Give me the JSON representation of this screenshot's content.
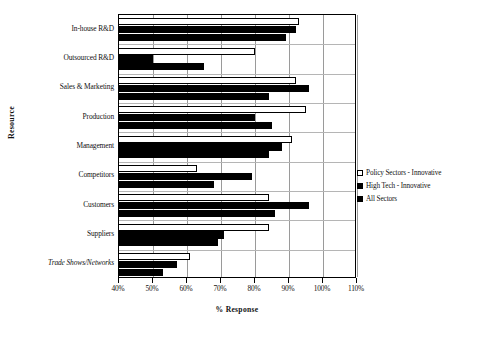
{
  "chart_data": {
    "type": "bar",
    "orientation": "horizontal",
    "title": "",
    "xlabel": "% Response",
    "ylabel": "Resource",
    "xlim": [
      40,
      110
    ],
    "xticks": [
      40,
      50,
      60,
      70,
      80,
      90,
      100,
      110
    ],
    "xtick_labels": [
      "40%",
      "50%",
      "60%",
      "70%",
      "80%",
      "90%",
      "100%",
      "110%"
    ],
    "grid": true,
    "legend_position": "right",
    "categories": [
      "In-house R&D",
      "Outsourced R&D",
      "Sales & Marketing",
      "Production",
      "Management",
      "Competitors",
      "Customers",
      "Suppliers",
      "Trade Shows/Networks"
    ],
    "series": [
      {
        "name": "Policy Sectors - Innovative",
        "color": "#ffffff",
        "values": [
          93,
          80,
          92,
          95,
          91,
          63,
          84,
          84,
          61
        ]
      },
      {
        "name": "High Tech - Innovative",
        "color": "#000000",
        "values": [
          92,
          50,
          96,
          80,
          88,
          79,
          96,
          71,
          57
        ]
      },
      {
        "name": "All Sectors",
        "color": "#000000",
        "values": [
          89,
          65,
          84,
          85,
          84,
          68,
          86,
          69,
          53
        ]
      }
    ]
  },
  "legend": {
    "items": [
      {
        "label": "Policy Sectors - Innovative",
        "swatch": "#ffffff"
      },
      {
        "label": "High Tech - Innovative",
        "swatch": "#000000"
      },
      {
        "label": "All Sectors",
        "swatch": "#000000"
      }
    ]
  }
}
